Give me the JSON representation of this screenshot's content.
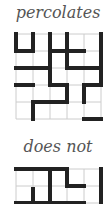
{
  "figure": {
    "panels": [
      {
        "caption": "percolates",
        "grid_size": 5,
        "origin": [
          16,
          34
        ],
        "cell": 17,
        "thick_segments": [
          [
            [
              16,
              34
            ],
            [
              16,
              51
            ]
          ],
          [
            [
              16,
              51
            ],
            [
              33,
              51
            ]
          ],
          [
            [
              33,
              34
            ],
            [
              33,
              51
            ]
          ],
          [
            [
              50,
              34
            ],
            [
              50,
              85
            ]
          ],
          [
            [
              67,
              34
            ],
            [
              67,
              68
            ]
          ],
          [
            [
              50,
              51
            ],
            [
              84,
              51
            ]
          ],
          [
            [
              67,
              68
            ],
            [
              101,
              68
            ]
          ],
          [
            [
              101,
              34
            ],
            [
              101,
              85
            ]
          ],
          [
            [
              16,
              68
            ],
            [
              50,
              68
            ]
          ],
          [
            [
              16,
              85
            ],
            [
              33,
              85
            ]
          ],
          [
            [
              50,
              85
            ],
            [
              67,
              85
            ]
          ],
          [
            [
              67,
              85
            ],
            [
              67,
              102
            ]
          ],
          [
            [
              33,
              102
            ],
            [
              67,
              102
            ]
          ],
          [
            [
              33,
              102
            ],
            [
              33,
              119
            ]
          ],
          [
            [
              84,
              85
            ],
            [
              101,
              85
            ]
          ],
          [
            [
              84,
              85
            ],
            [
              84,
              102
            ]
          ],
          [
            [
              84,
              119
            ],
            [
              101,
              119
            ]
          ]
        ]
      },
      {
        "caption": "does not",
        "grid_size": 5,
        "origin": [
          16,
          169
        ],
        "cell": 17,
        "thick_segments": [
          [
            [
              16,
              169
            ],
            [
              67,
              169
            ]
          ],
          [
            [
              50,
              169
            ],
            [
              50,
              204
            ]
          ],
          [
            [
              67,
              169
            ],
            [
              67,
              186
            ]
          ],
          [
            [
              67,
              186
            ],
            [
              84,
              186
            ]
          ],
          [
            [
              33,
              189
            ],
            [
              33,
              204
            ]
          ],
          [
            [
              101,
              169
            ],
            [
              101,
              204
            ]
          ],
          [
            [
              16,
              203
            ],
            [
              84,
              203
            ]
          ]
        ]
      }
    ],
    "colors": {
      "thin_grid": "#cccccc",
      "thick_edge": "#222222",
      "caption": "#555555",
      "background": "#ffffff"
    }
  }
}
